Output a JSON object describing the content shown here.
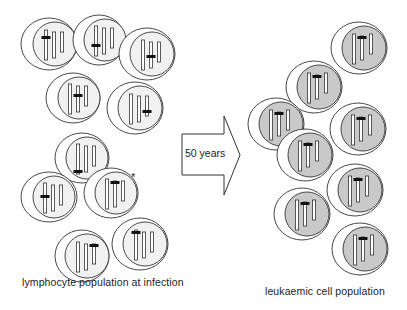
{
  "arrow": {
    "label": "50 years",
    "icon": "right-arrow-icon"
  },
  "left_group": {
    "caption": "lymphocyte population at infection",
    "inner_fill": "#f1f1f1",
    "star_marker": "*",
    "cells": [
      {
        "cx": 49,
        "cy": 44,
        "rx": 28,
        "ry": 26,
        "dx": 6,
        "marker_chrom": 0,
        "marker_y": -8
      },
      {
        "cx": 99,
        "cy": 40,
        "rx": 26,
        "ry": 25,
        "dx": 6,
        "marker_chrom": 0,
        "marker_y": 4
      },
      {
        "cx": 147,
        "cy": 54,
        "rx": 28,
        "ry": 26,
        "dx": 5,
        "marker_chrom": 1,
        "marker_y": 1
      },
      {
        "cx": 73,
        "cy": 98,
        "rx": 27,
        "ry": 25,
        "dx": 6,
        "marker_chrom": 1,
        "marker_y": -4
      },
      {
        "cx": 135,
        "cy": 108,
        "rx": 28,
        "ry": 26,
        "dx": 5,
        "marker_chrom": 2,
        "marker_y": 2
      },
      {
        "cx": 82,
        "cy": 158,
        "rx": 27,
        "ry": 25,
        "dx": 5,
        "marker_chrom": 0,
        "marker_y": 12
      },
      {
        "cx": 49,
        "cy": 197,
        "rx": 28,
        "ry": 25,
        "dx": 5,
        "marker_chrom": 0,
        "marker_y": -2
      },
      {
        "cx": 111,
        "cy": 193,
        "rx": 27,
        "ry": 25,
        "dx": 5,
        "marker_chrom": 1,
        "marker_y": -12
      },
      {
        "cx": 82,
        "cy": 256,
        "rx": 27,
        "ry": 26,
        "dx": 5,
        "marker_chrom": 2,
        "marker_y": -12
      },
      {
        "cx": 140,
        "cy": 244,
        "rx": 28,
        "ry": 26,
        "dx": 5,
        "marker_chrom": 0,
        "marker_y": -13
      }
    ]
  },
  "right_group": {
    "caption": "leukaemic cell population",
    "inner_fill": "#c9c9c9",
    "cells": [
      {
        "cx": 359,
        "cy": 48,
        "rx": 28,
        "ry": 26,
        "dx": 5,
        "marker_chrom": 1,
        "marker_y": -12
      },
      {
        "cx": 314,
        "cy": 87,
        "rx": 28,
        "ry": 26,
        "dx": 5,
        "marker_chrom": 1,
        "marker_y": -12
      },
      {
        "cx": 276,
        "cy": 124,
        "rx": 28,
        "ry": 26,
        "dx": 5,
        "marker_chrom": 1,
        "marker_y": -12
      },
      {
        "cx": 358,
        "cy": 129,
        "rx": 28,
        "ry": 26,
        "dx": 5,
        "marker_chrom": 1,
        "marker_y": -12
      },
      {
        "cx": 305,
        "cy": 155,
        "rx": 28,
        "ry": 26,
        "dx": 5,
        "marker_chrom": 1,
        "marker_y": -12
      },
      {
        "cx": 355,
        "cy": 190,
        "rx": 28,
        "ry": 26,
        "dx": 5,
        "marker_chrom": 1,
        "marker_y": -12
      },
      {
        "cx": 302,
        "cy": 214,
        "rx": 28,
        "ry": 26,
        "dx": 5,
        "marker_chrom": 1,
        "marker_y": -12
      },
      {
        "cx": 360,
        "cy": 249,
        "rx": 28,
        "ry": 26,
        "dx": 5,
        "marker_chrom": 1,
        "marker_y": -12
      }
    ]
  },
  "colors": {
    "stroke": "#333333",
    "marker": "#111111",
    "chromosome_fill": "#ffffff",
    "outer_fill": "#ffffff"
  }
}
